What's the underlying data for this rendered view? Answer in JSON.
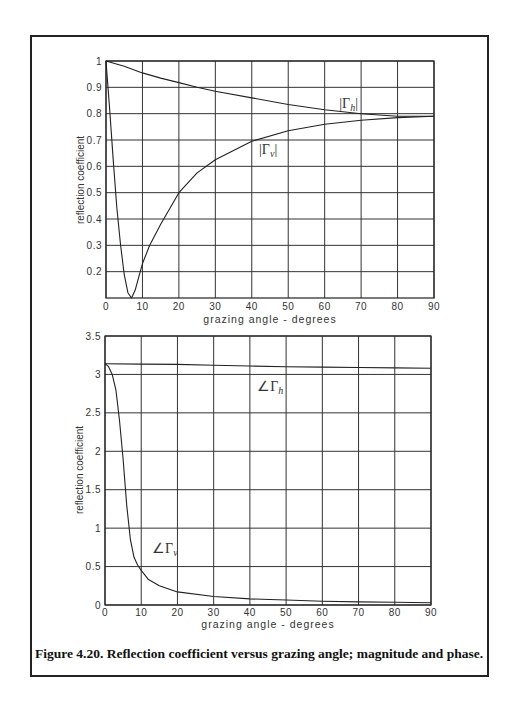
{
  "figure": {
    "caption": "Figure 4.20. Reflection coefficient versus grazing angle; magnitude and phase."
  },
  "chart_data": [
    {
      "type": "line",
      "title": "",
      "xlabel": "grazing angle - degrees",
      "ylabel": "reflection coefficient",
      "xlim": [
        0,
        90
      ],
      "ylim": [
        0.1,
        1
      ],
      "xticks": [
        0,
        10,
        20,
        30,
        40,
        50,
        60,
        70,
        80,
        90
      ],
      "yticks": [
        0.2,
        0.3,
        0.4,
        0.5,
        0.6,
        0.7,
        0.8,
        0.9,
        1
      ],
      "ytick_labels": [
        "0.2",
        "0.3",
        "0.4",
        "0.5",
        "0.6",
        "0.7",
        "0.8",
        "0.9",
        "1"
      ],
      "grid": true,
      "series": [
        {
          "name": "|Γh|",
          "x": [
            0,
            5,
            10,
            15,
            20,
            25,
            30,
            40,
            50,
            60,
            70,
            75,
            80,
            85,
            90
          ],
          "values": [
            1.0,
            0.98,
            0.955,
            0.935,
            0.918,
            0.9,
            0.885,
            0.86,
            0.835,
            0.815,
            0.8,
            0.795,
            0.79,
            0.79,
            0.79
          ]
        },
        {
          "name": "|Γv|",
          "x": [
            0,
            1,
            2,
            3,
            4,
            5,
            6,
            7,
            8,
            9,
            10,
            12,
            15,
            20,
            25,
            30,
            40,
            50,
            60,
            70,
            80,
            90
          ],
          "values": [
            1.0,
            0.82,
            0.62,
            0.44,
            0.3,
            0.19,
            0.12,
            0.1,
            0.13,
            0.18,
            0.23,
            0.3,
            0.38,
            0.5,
            0.575,
            0.625,
            0.695,
            0.735,
            0.76,
            0.775,
            0.785,
            0.79
          ]
        }
      ],
      "annotations": [
        {
          "text": "|Γh|",
          "x": 64,
          "y": 0.82
        },
        {
          "text": "|Γv|",
          "x": 42,
          "y": 0.645
        }
      ]
    },
    {
      "type": "line",
      "title": "",
      "xlabel": "grazing angle - degrees",
      "ylabel": "reflection coefficient",
      "xlim": [
        0,
        90
      ],
      "ylim": [
        0,
        3.5
      ],
      "xticks": [
        0,
        10,
        20,
        30,
        40,
        50,
        60,
        70,
        80,
        90
      ],
      "yticks": [
        0,
        0.5,
        1,
        1.5,
        2,
        2.5,
        3,
        3.5
      ],
      "ytick_labels": [
        "0",
        "0.5",
        "1",
        "1.5",
        "2",
        "2.5",
        "3",
        "3.5"
      ],
      "grid": true,
      "series": [
        {
          "name": "∠Γh",
          "x": [
            0,
            10,
            20,
            30,
            40,
            50,
            60,
            70,
            80,
            90
          ],
          "values": [
            3.14,
            3.135,
            3.13,
            3.12,
            3.11,
            3.1,
            3.095,
            3.09,
            3.085,
            3.08
          ]
        },
        {
          "name": "∠Γv",
          "x": [
            0,
            1,
            2,
            3,
            4,
            5,
            6,
            7,
            8,
            9,
            10,
            12,
            15,
            20,
            30,
            40,
            50,
            60,
            70,
            80,
            90
          ],
          "values": [
            3.14,
            3.1,
            3.0,
            2.8,
            2.4,
            1.9,
            1.3,
            0.85,
            0.62,
            0.52,
            0.45,
            0.33,
            0.25,
            0.17,
            0.11,
            0.08,
            0.065,
            0.05,
            0.04,
            0.035,
            0.03
          ]
        }
      ],
      "annotations": [
        {
          "text": "∠Γh",
          "x": 42,
          "y": 2.78
        },
        {
          "text": "∠Γv",
          "x": 13,
          "y": 0.68
        }
      ]
    }
  ]
}
